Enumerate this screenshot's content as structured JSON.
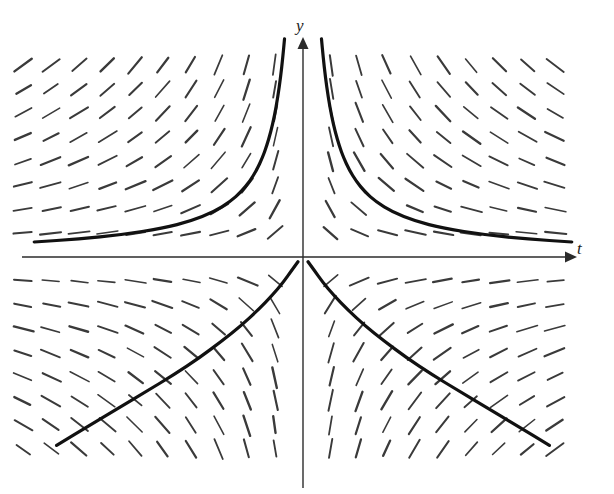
{
  "figure": {
    "caption": "",
    "background_color": "#ffffff",
    "width": 614,
    "height": 494
  },
  "axes": {
    "x_axis": {
      "label": "t",
      "name": "t-axis",
      "color": "#2b2b2b",
      "arrow": "right",
      "pixel_y": 257,
      "pixel_x_start": 22,
      "pixel_x_end": 568
    },
    "y_axis": {
      "label": "y",
      "name": "y-axis",
      "color": "#2b2b2b",
      "arrow": "up",
      "pixel_x": 303,
      "pixel_y_start": 46,
      "pixel_y_end": 488
    },
    "origin": {
      "x": 303,
      "y": 257
    }
  },
  "chart_data": {
    "type": "line",
    "title": "",
    "subtitle": "",
    "xlabel": "t",
    "ylabel": "y",
    "xlim": [
      -10.0,
      10.0
    ],
    "ylim": [
      -9.0,
      9.0
    ],
    "grid": false,
    "legend": null,
    "tick_labels": {
      "x": [],
      "y": []
    },
    "equation": "y' = -y/t",
    "slope_field": {
      "name": "direction-field",
      "style": "short dashed tick marks",
      "color": "#3a3a3a",
      "mark_length_px": 19,
      "columns": 20,
      "rows": 17,
      "x_start": -10.0,
      "x_step": 1.0,
      "y_start": -8.0,
      "y_step": 1.0,
      "omit_axis_row": true,
      "omit_axis_col": false
    },
    "series": [
      {
        "name": "solution-curve-upper-left",
        "curve_id": "upper-left",
        "branch": "quadrant-II",
        "constant_c": -6.0,
        "color": "#111111",
        "linewidth": 3.2,
        "t_range": [
          -9.6,
          -0.45
        ],
        "points": [
          [
            -9.6,
            0.625
          ],
          [
            -8.0,
            0.75
          ],
          [
            -6.5,
            0.923
          ],
          [
            -5.0,
            1.2
          ],
          [
            -4.0,
            1.5
          ],
          [
            -3.2,
            1.875
          ],
          [
            -2.6,
            2.308
          ],
          [
            -2.2,
            2.727
          ],
          [
            -1.9,
            3.158
          ],
          [
            -1.65,
            3.636
          ],
          [
            -1.45,
            4.138
          ],
          [
            -1.3,
            4.615
          ],
          [
            -1.15,
            5.217
          ],
          [
            -1.02,
            5.882
          ],
          [
            -0.9,
            6.667
          ],
          [
            -0.8,
            7.5
          ],
          [
            -0.72,
            8.333
          ],
          [
            -0.66,
            9.09
          ],
          [
            -0.6,
            10.0
          ]
        ]
      },
      {
        "name": "solution-curve-upper-right",
        "curve_id": "upper-right",
        "branch": "quadrant-I",
        "constant_c": 6.0,
        "color": "#111111",
        "linewidth": 3.2,
        "t_range": [
          0.45,
          9.6
        ],
        "points": [
          [
            9.6,
            0.625
          ],
          [
            8.0,
            0.75
          ],
          [
            6.5,
            0.923
          ],
          [
            5.0,
            1.2
          ],
          [
            4.0,
            1.5
          ],
          [
            3.2,
            1.875
          ],
          [
            2.6,
            2.308
          ],
          [
            2.2,
            2.727
          ],
          [
            1.9,
            3.158
          ],
          [
            1.65,
            3.636
          ],
          [
            1.45,
            4.138
          ],
          [
            1.3,
            4.615
          ],
          [
            1.15,
            5.217
          ],
          [
            1.02,
            5.882
          ],
          [
            0.9,
            6.667
          ],
          [
            0.8,
            7.5
          ],
          [
            0.72,
            8.333
          ],
          [
            0.66,
            9.09
          ],
          [
            0.6,
            10.0
          ]
        ]
      },
      {
        "name": "solution-curve-lower-left",
        "curve_id": "lower-left",
        "branch": "quadrant-III",
        "constant_c": -1.6,
        "color": "#111111",
        "linewidth": 3.2,
        "t_range": [
          -8.8,
          -0.18
        ],
        "points": [
          [
            -0.18,
            -0.2
          ],
          [
            -0.4,
            -0.55
          ],
          [
            -0.7,
            -1.05
          ],
          [
            -1.1,
            -1.6
          ],
          [
            -1.6,
            -2.2
          ],
          [
            -2.2,
            -2.85
          ],
          [
            -2.9,
            -3.5
          ],
          [
            -3.7,
            -4.2
          ],
          [
            -4.6,
            -4.9
          ],
          [
            -5.6,
            -5.6
          ],
          [
            -6.6,
            -6.3
          ],
          [
            -7.6,
            -7.0
          ],
          [
            -8.8,
            -7.85
          ]
        ]
      },
      {
        "name": "solution-curve-lower-right",
        "curve_id": "lower-right",
        "branch": "quadrant-IV",
        "constant_c": 1.6,
        "color": "#111111",
        "linewidth": 3.2,
        "t_range": [
          0.18,
          8.8
        ],
        "points": [
          [
            0.18,
            -0.2
          ],
          [
            0.4,
            -0.55
          ],
          [
            0.7,
            -1.05
          ],
          [
            1.1,
            -1.6
          ],
          [
            1.6,
            -2.2
          ],
          [
            2.2,
            -2.85
          ],
          [
            2.9,
            -3.5
          ],
          [
            3.7,
            -4.2
          ],
          [
            4.6,
            -4.9
          ],
          [
            5.6,
            -5.6
          ],
          [
            6.6,
            -6.3
          ],
          [
            7.6,
            -7.0
          ],
          [
            8.8,
            -7.85
          ]
        ]
      }
    ]
  }
}
